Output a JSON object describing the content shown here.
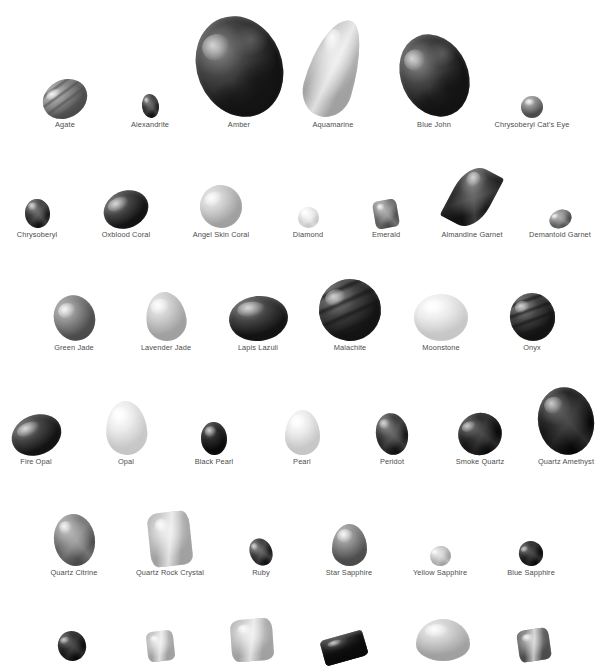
{
  "plate": {
    "title_partial": "",
    "background_color": "#ffffff",
    "label_color": "#4d4d4d",
    "rendering": "grayscale",
    "note": "black and white photographic plate of polished gemstones with printed captions"
  },
  "rows": [
    {
      "row_index": 1,
      "top": 8,
      "baseline": 118,
      "items": [
        {
          "label": "Agate",
          "cx": 65,
          "w": 46,
          "h": 38,
          "shape": "oval",
          "tone": "mid",
          "rot": -28,
          "pattern": "banded"
        },
        {
          "label": "Alexandrite",
          "cx": 150,
          "w": 17,
          "h": 24,
          "shape": "oval",
          "tone": "dark",
          "rot": -8,
          "pattern": "faceted"
        },
        {
          "label": "Amber",
          "cx": 239,
          "w": 85,
          "h": 103,
          "shape": "oval",
          "tone": "dark",
          "rot": -22,
          "pattern": "mottled"
        },
        {
          "label": "Aquamarine",
          "cx": 333,
          "w": 49,
          "h": 100,
          "shape": "pear",
          "tone": "light",
          "rot": 16,
          "pattern": "crystal"
        },
        {
          "label": "Blue John",
          "cx": 434,
          "w": 67,
          "h": 85,
          "shape": "oval",
          "tone": "dark",
          "rot": -24,
          "pattern": "mottled"
        },
        {
          "label": "Chrysoberyl Cat's Eye",
          "cx": 532,
          "w": 22,
          "h": 22,
          "shape": "round",
          "tone": "mid",
          "rot": 0,
          "pattern": "cabochon"
        }
      ]
    },
    {
      "row_index": 2,
      "top": 170,
      "baseline": 228,
      "items": [
        {
          "label": "Chrysoberyl",
          "cx": 37,
          "w": 25,
          "h": 29,
          "shape": "oval",
          "tone": "dark",
          "rot": -6,
          "pattern": "faceted"
        },
        {
          "label": "Oxblood Coral",
          "cx": 126,
          "w": 46,
          "h": 37,
          "shape": "oval",
          "tone": "dark",
          "rot": -24,
          "pattern": "cabochon"
        },
        {
          "label": "Angel Skin Coral",
          "cx": 221,
          "w": 42,
          "h": 43,
          "shape": "round",
          "tone": "light",
          "rot": -18,
          "pattern": "cabochon"
        },
        {
          "label": "Diamond",
          "cx": 308,
          "w": 21,
          "h": 21,
          "shape": "round",
          "tone": "verylight",
          "rot": 0,
          "pattern": "brilliant"
        },
        {
          "label": "Emerald",
          "cx": 386,
          "w": 24,
          "h": 28,
          "shape": "cushion",
          "tone": "mid",
          "rot": -10,
          "pattern": "step-cut"
        },
        {
          "label": "Almandine Garnet",
          "cx": 472,
          "w": 40,
          "h": 62,
          "shape": "marquise",
          "tone": "dark",
          "rot": 28,
          "pattern": "faceted"
        },
        {
          "label": "Demantoid Garnet",
          "cx": 560,
          "w": 23,
          "h": 18,
          "shape": "oval",
          "tone": "mid",
          "rot": -22,
          "pattern": "faceted"
        }
      ]
    },
    {
      "row_index": 3,
      "top": 285,
      "baseline": 341,
      "items": [
        {
          "label": "Green Jade",
          "cx": 74,
          "w": 41,
          "h": 46,
          "shape": "oval",
          "tone": "mid",
          "rot": -20,
          "pattern": "cabochon"
        },
        {
          "label": "Lavender Jade",
          "cx": 166,
          "w": 40,
          "h": 49,
          "shape": "egg",
          "tone": "light",
          "rot": -8,
          "pattern": "cabochon"
        },
        {
          "label": "Lapis Lazuli",
          "cx": 258,
          "w": 59,
          "h": 45,
          "shape": "oval",
          "tone": "dark",
          "rot": -6,
          "pattern": "cabochon"
        },
        {
          "label": "Malachite",
          "cx": 350,
          "w": 62,
          "h": 62,
          "shape": "oval",
          "tone": "dark",
          "rot": -16,
          "pattern": "banded"
        },
        {
          "label": "Moonstone",
          "cx": 441,
          "w": 54,
          "h": 47,
          "shape": "round",
          "tone": "verylight",
          "rot": 0,
          "pattern": "cabochon"
        },
        {
          "label": "Onyx",
          "cx": 532,
          "w": 45,
          "h": 48,
          "shape": "oval",
          "tone": "dark",
          "rot": -12,
          "pattern": "banded"
        }
      ]
    },
    {
      "row_index": 4,
      "top": 395,
      "baseline": 455,
      "items": [
        {
          "label": "Fire Opal",
          "cx": 36,
          "w": 51,
          "h": 40,
          "shape": "oval",
          "tone": "dark",
          "rot": -22,
          "pattern": "cabochon"
        },
        {
          "label": "Opal",
          "cx": 126,
          "w": 41,
          "h": 54,
          "shape": "egg",
          "tone": "verylight",
          "rot": -4,
          "pattern": "cabochon"
        },
        {
          "label": "Black Pearl",
          "cx": 214,
          "w": 26,
          "h": 33,
          "shape": "oval",
          "tone": "verydark",
          "rot": -4,
          "pattern": "pearl"
        },
        {
          "label": "Pearl",
          "cx": 302,
          "w": 35,
          "h": 45,
          "shape": "egg",
          "tone": "verylight",
          "rot": 0,
          "pattern": "pearl"
        },
        {
          "label": "Peridot",
          "cx": 392,
          "w": 32,
          "h": 42,
          "shape": "oval",
          "tone": "dark",
          "rot": -10,
          "pattern": "faceted"
        },
        {
          "label": "Smoke Quartz",
          "cx": 480,
          "w": 44,
          "h": 42,
          "shape": "oval",
          "tone": "verydark",
          "rot": -22,
          "pattern": "faceted"
        },
        {
          "label": "Quartz Amethyst",
          "cx": 566,
          "w": 56,
          "h": 68,
          "shape": "oval",
          "tone": "verydark",
          "rot": -10,
          "pattern": "faceted"
        }
      ]
    },
    {
      "row_index": 5,
      "top": 508,
      "baseline": 566,
      "items": [
        {
          "label": "Quartz Citrine",
          "cx": 74,
          "w": 41,
          "h": 52,
          "shape": "oval",
          "tone": "mid",
          "rot": -8,
          "pattern": "faceted"
        },
        {
          "label": "Quartz Rock Crystal",
          "cx": 170,
          "w": 42,
          "h": 54,
          "shape": "rough",
          "tone": "light",
          "rot": -6,
          "pattern": "crystal"
        },
        {
          "label": "Ruby",
          "cx": 261,
          "w": 22,
          "h": 28,
          "shape": "oval",
          "tone": "dark",
          "rot": -24,
          "pattern": "faceted"
        },
        {
          "label": "Star Sapphire",
          "cx": 349,
          "w": 35,
          "h": 42,
          "shape": "egg",
          "tone": "mid",
          "rot": 0,
          "pattern": "cabochon"
        },
        {
          "label": "Yellow Sapphire",
          "cx": 440,
          "w": 21,
          "h": 20,
          "shape": "oval",
          "tone": "light",
          "rot": -18,
          "pattern": "faceted"
        },
        {
          "label": "Blue Sapphire",
          "cx": 531,
          "w": 24,
          "h": 25,
          "shape": "oval",
          "tone": "verydark",
          "rot": -24,
          "pattern": "faceted"
        }
      ]
    },
    {
      "row_index": 6,
      "top": 630,
      "baseline": 661,
      "cut_off": true,
      "items": [
        {
          "label": "",
          "cx": 72,
          "w": 28,
          "h": 30,
          "shape": "oval",
          "tone": "verydark",
          "rot": -18,
          "pattern": "faceted"
        },
        {
          "label": "",
          "cx": 160,
          "w": 27,
          "h": 30,
          "shape": "rough",
          "tone": "light",
          "rot": -6,
          "pattern": "crystal"
        },
        {
          "label": "",
          "cx": 252,
          "w": 42,
          "h": 42,
          "shape": "rough",
          "tone": "light",
          "rot": -4,
          "pattern": "crystal"
        },
        {
          "label": "",
          "cx": 344,
          "w": 44,
          "h": 26,
          "shape": "bar",
          "tone": "verydark",
          "rot": -16,
          "pattern": "prism"
        },
        {
          "label": "",
          "cx": 443,
          "w": 54,
          "h": 42,
          "shape": "egg",
          "tone": "light",
          "rot": 0,
          "pattern": "cabochon"
        },
        {
          "label": "",
          "cx": 534,
          "w": 32,
          "h": 32,
          "shape": "rough",
          "tone": "mid",
          "rot": -8,
          "pattern": "crystal"
        }
      ]
    }
  ]
}
